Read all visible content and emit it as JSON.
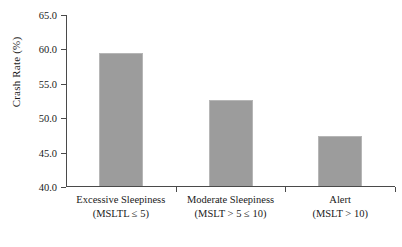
{
  "chart_data": {
    "type": "bar",
    "title": "",
    "xlabel": "",
    "ylabel": "Crash Rate (%)",
    "ylim": [
      40.0,
      65.0
    ],
    "yticks": [
      "40.0",
      "45.0",
      "50.0",
      "55.0",
      "60.0",
      "65.0"
    ],
    "ytick_values": [
      40.0,
      45.0,
      50.0,
      55.0,
      60.0,
      65.0
    ],
    "grid": false,
    "legend": false,
    "bar_color": "#9c9c9c",
    "axis_color": "#4a4a4a",
    "background": "#ffffff",
    "categories": [
      "Excessive Sleepiness (MSLTL ≤ 5)",
      "Moderate Sleepiness (MSLT > 5 ≤ 10)",
      "Alert (MSLT > 10)"
    ],
    "values": [
      59.3,
      52.5,
      47.2
    ],
    "bars": [
      {
        "line1": "Excessive Sleepiness",
        "line2": "(MSLTL ≤ 5)",
        "value": 59.3
      },
      {
        "line1": "Moderate Sleepiness",
        "line2": "(MSLT  > 5 ≤ 10)",
        "value": 52.5
      },
      {
        "line1": "Alert",
        "line2": "(MSLT  > 10)",
        "value": 47.2
      }
    ]
  }
}
